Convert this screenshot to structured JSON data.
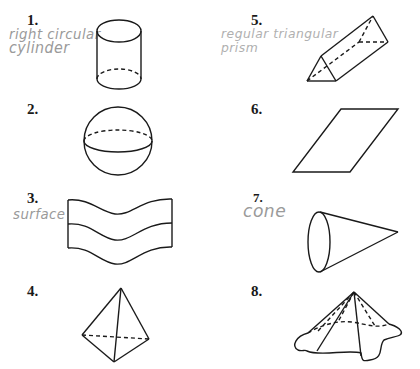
{
  "problems": [
    {
      "number": "1.",
      "answer_line1": "right circular",
      "answer_line2": "cylinder",
      "figure": "cylinder"
    },
    {
      "number": "2.",
      "answer_line1": "",
      "answer_line2": "",
      "figure": "sphere"
    },
    {
      "number": "3.",
      "answer_line1": "surface",
      "answer_line2": "",
      "figure": "wavy-surface"
    },
    {
      "number": "4.",
      "answer_line1": "",
      "answer_line2": "",
      "figure": "tetrahedron"
    },
    {
      "number": "5.",
      "answer_line1": "regular triangular",
      "answer_line2": "prism",
      "figure": "triangular-prism"
    },
    {
      "number": "6.",
      "answer_line1": "",
      "answer_line2": "",
      "figure": "parallelogram"
    },
    {
      "number": "7.",
      "answer_line1": "cone",
      "answer_line2": "",
      "figure": "cone"
    },
    {
      "number": "8.",
      "answer_line1": "",
      "answer_line2": "",
      "figure": "general-cone"
    }
  ],
  "colors": {
    "ink": "#1a1a1a",
    "handwriting": "#9a9a9a"
  }
}
